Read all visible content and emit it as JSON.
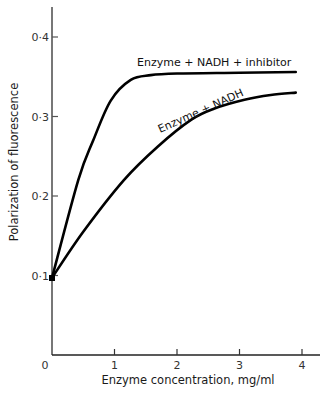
{
  "chart_data": {
    "type": "line",
    "title": "",
    "xlabel": "Enzyme concentration,  mg/ml",
    "ylabel": "Polarization  of  fluorescence",
    "xlim": [
      0,
      4.2
    ],
    "ylim": [
      0,
      0.44
    ],
    "grid": false,
    "legend_position": "inline labels on curves",
    "x_ticks": [
      0,
      1,
      2,
      3,
      4
    ],
    "x_tick_labels": [
      "0",
      "1",
      "2",
      "3",
      "4"
    ],
    "y_ticks": [
      0.1,
      0.2,
      0.3,
      0.4
    ],
    "y_tick_labels": [
      "0·1",
      "0·2",
      "0·3",
      "0·4"
    ],
    "series": [
      {
        "name": "Enzyme + NADH + inhibitor",
        "x": [
          0,
          0.42,
          0.66,
          0.94,
          1.26,
          1.58,
          2.0,
          3.0,
          3.9
        ],
        "values": [
          0.097,
          0.22,
          0.27,
          0.32,
          0.346,
          0.352,
          0.354,
          0.355,
          0.356
        ]
      },
      {
        "name": "Enzyme + NADH",
        "x": [
          0,
          0.5,
          1.15,
          1.69,
          2.23,
          2.6,
          3.08,
          3.5,
          3.9
        ],
        "values": [
          0.097,
          0.155,
          0.22,
          0.262,
          0.296,
          0.31,
          0.321,
          0.327,
          0.33
        ]
      }
    ]
  },
  "labels": {
    "series_inhibitor": "Enzyme + NADH + inhibitor",
    "series_nadh": "Enzyme + NADH",
    "x_origin": "0"
  }
}
